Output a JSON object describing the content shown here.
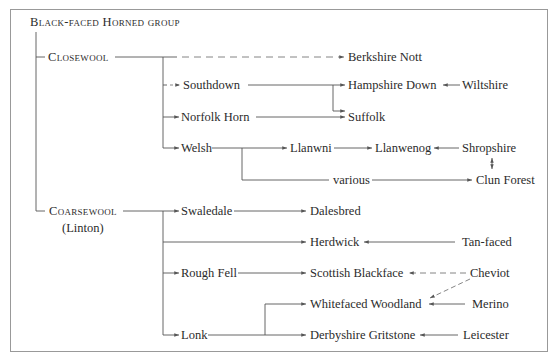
{
  "diagram": {
    "title": "Black-faced Horned group",
    "groups": {
      "closewool": {
        "label": "Closewool"
      },
      "coarsewool": {
        "label": "Coarsewool",
        "sub": "(Linton)"
      }
    },
    "nodes": {
      "berkshire_nott": "Berkshire Nott",
      "southdown": "Southdown",
      "hampshire_down": "Hampshire Down",
      "wiltshire": "Wiltshire",
      "norfolk_horn": "Norfolk Horn",
      "suffolk": "Suffolk",
      "welsh": "Welsh",
      "llanwni": "Llanwni",
      "llanwenog": "Llanwenog",
      "shropshire": "Shropshire",
      "various": "various",
      "clun_forest": "Clun Forest",
      "swaledale": "Swaledale",
      "dalesbred": "Dalesbred",
      "herdwick": "Herdwick",
      "tan_faced": "Tan-faced",
      "rough_fell": "Rough Fell",
      "scottish_blackface": "Scottish Blackface",
      "cheviot": "Cheviot",
      "whitefaced_woodland": "Whitefaced Woodland",
      "merino": "Merino",
      "lonk": "Lonk",
      "derbyshire_gritstone": "Derbyshire Gritstone",
      "leicester": "Leicester"
    },
    "edges": [
      {
        "from": "Closewool",
        "to": "Berkshire Nott",
        "style": "dashed"
      },
      {
        "from": "Closewool",
        "to": "Southdown",
        "style": "dashed"
      },
      {
        "from": "Closewool",
        "to": "Norfolk Horn",
        "style": "solid"
      },
      {
        "from": "Closewool",
        "to": "Welsh",
        "style": "solid"
      },
      {
        "from": "Southdown",
        "to": "Hampshire Down",
        "style": "solid"
      },
      {
        "from": "Southdown",
        "to": "Suffolk",
        "style": "solid"
      },
      {
        "from": "Wiltshire",
        "to": "Hampshire Down",
        "style": "solid"
      },
      {
        "from": "Norfolk Horn",
        "to": "Suffolk",
        "style": "solid"
      },
      {
        "from": "Welsh",
        "to": "Llanwni",
        "style": "solid"
      },
      {
        "from": "Welsh",
        "to": "Clun Forest",
        "style": "solid",
        "via": "various"
      },
      {
        "from": "Llanwni",
        "to": "Llanwenog",
        "style": "solid"
      },
      {
        "from": "Shropshire",
        "to": "Llanwenog",
        "style": "solid"
      },
      {
        "from": "Shropshire",
        "to": "Clun Forest",
        "style": "bidirectional"
      },
      {
        "from": "Coarsewool",
        "to": "Swaledale",
        "style": "solid"
      },
      {
        "from": "Coarsewool",
        "to": "Herdwick",
        "style": "solid"
      },
      {
        "from": "Coarsewool",
        "to": "Rough Fell",
        "style": "solid"
      },
      {
        "from": "Coarsewool",
        "to": "Lonk",
        "style": "solid"
      },
      {
        "from": "Swaledale",
        "to": "Dalesbred",
        "style": "solid"
      },
      {
        "from": "Tan-faced",
        "to": "Herdwick",
        "style": "solid"
      },
      {
        "from": "Rough Fell",
        "to": "Scottish Blackface",
        "style": "solid"
      },
      {
        "from": "Cheviot",
        "to": "Scottish Blackface",
        "style": "dashed"
      },
      {
        "from": "Cheviot",
        "to": "Whitefaced Woodland",
        "style": "dashed"
      },
      {
        "from": "Merino",
        "to": "Whitefaced Woodland",
        "style": "solid"
      },
      {
        "from": "Lonk",
        "to": "Whitefaced Woodland",
        "style": "solid"
      },
      {
        "from": "Lonk",
        "to": "Derbyshire Gritstone",
        "style": "solid"
      },
      {
        "from": "Leicester",
        "to": "Derbyshire Gritstone",
        "style": "solid"
      }
    ]
  }
}
